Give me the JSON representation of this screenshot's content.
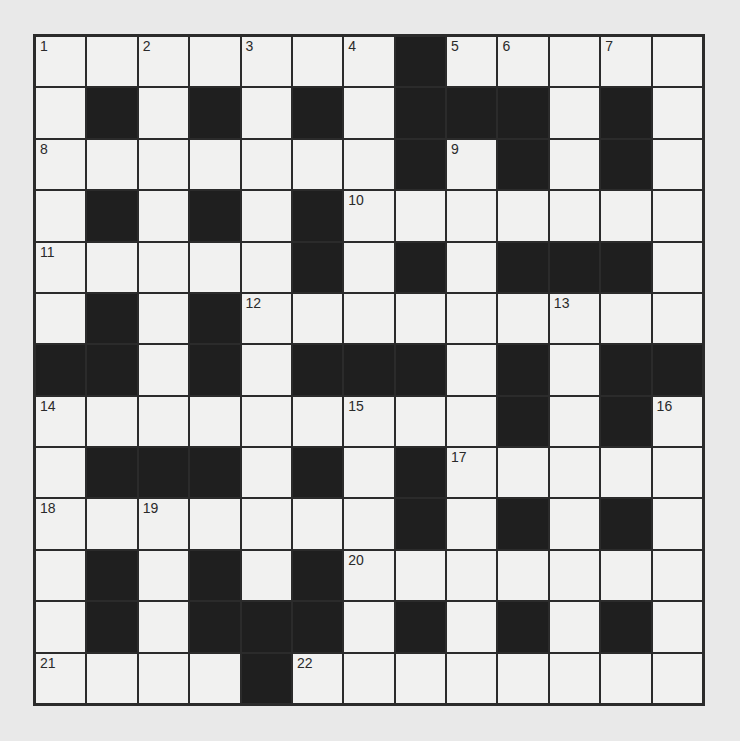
{
  "puzzle": {
    "type": "crossword",
    "rows": 13,
    "cols": 13,
    "colors": {
      "block": "#1f1f1f",
      "cell": "#f1f1f0",
      "grid_line": "#2b2b2b",
      "background": "#e9e9e9"
    },
    "grid": [
      "WWWWWWWBWWWWW",
      "WBWBWBWBBBWBW",
      "WWWWWWWBWBWBW",
      "WBWBWBWWWWWWW",
      "WWWWWBWBWBBBW",
      "WBWBWWWWWWWWW",
      "BBWBWBBBWBWBB",
      "WWWWWWWWWBWBW",
      "WBBBWBWBWWWWW",
      "WWWWWWWBWBWBW",
      "WBWBWBWWWWWWW",
      "WBWBBBWBWBWBW",
      "WWWWBWWWWWWWW"
    ],
    "numbers": [
      {
        "n": "1",
        "r": 0,
        "c": 0
      },
      {
        "n": "2",
        "r": 0,
        "c": 2
      },
      {
        "n": "3",
        "r": 0,
        "c": 4
      },
      {
        "n": "4",
        "r": 0,
        "c": 6
      },
      {
        "n": "5",
        "r": 0,
        "c": 8
      },
      {
        "n": "6",
        "r": 0,
        "c": 9
      },
      {
        "n": "7",
        "r": 0,
        "c": 11
      },
      {
        "n": "8",
        "r": 2,
        "c": 0
      },
      {
        "n": "9",
        "r": 2,
        "c": 8
      },
      {
        "n": "10",
        "r": 3,
        "c": 6
      },
      {
        "n": "11",
        "r": 4,
        "c": 0
      },
      {
        "n": "12",
        "r": 5,
        "c": 4
      },
      {
        "n": "13",
        "r": 5,
        "c": 10
      },
      {
        "n": "14",
        "r": 7,
        "c": 0
      },
      {
        "n": "15",
        "r": 7,
        "c": 6
      },
      {
        "n": "16",
        "r": 7,
        "c": 12
      },
      {
        "n": "17",
        "r": 8,
        "c": 8
      },
      {
        "n": "18",
        "r": 9,
        "c": 0
      },
      {
        "n": "19",
        "r": 9,
        "c": 2
      },
      {
        "n": "20",
        "r": 10,
        "c": 6
      },
      {
        "n": "21",
        "r": 12,
        "c": 0
      },
      {
        "n": "22",
        "r": 12,
        "c": 5
      }
    ]
  }
}
